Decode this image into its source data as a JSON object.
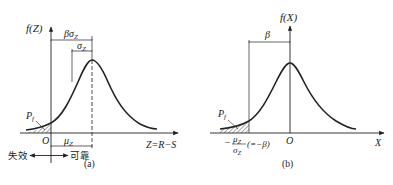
{
  "panel_a": {
    "caption": "(a)",
    "y_axis_label": "f(Z)",
    "x_axis_label": "Z=R−S",
    "origin_label": "O",
    "dim_beta_sigma": "βσ",
    "dim_beta_sigma_sub": "Z",
    "dim_sigma": "σ",
    "dim_sigma_sub": "Z",
    "dim_mu": "μ",
    "dim_mu_sub": "Z",
    "pf_label": "P",
    "pf_sub": "f",
    "failure_label": "失效",
    "reliable_label": "可靠"
  },
  "panel_b": {
    "caption": "(b)",
    "y_axis_label": "f(X)",
    "x_axis_label": "X",
    "origin_label": "O",
    "dim_beta": "β",
    "pf_label": "P",
    "pf_sub": "f",
    "tick_label_num": "μ",
    "tick_label_num_sub": "Z",
    "tick_label_den": "σ",
    "tick_label_den_sub": "Z",
    "tick_label_minus": "−",
    "tick_label_eq": "(=−β)"
  },
  "colors": {
    "line": "#222222",
    "background": "#ffffff"
  }
}
